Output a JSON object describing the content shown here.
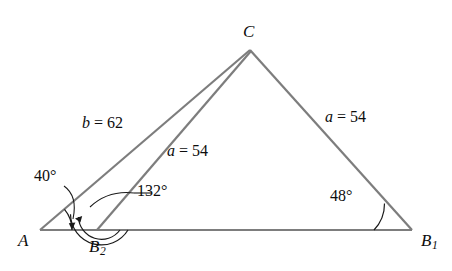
{
  "figure": {
    "type": "geometry-diagram",
    "vertices": [
      {
        "id": "C",
        "label": "C",
        "sub": "",
        "x": 250,
        "y": 50
      },
      {
        "id": "A",
        "label": "A",
        "sub": "",
        "x": 40,
        "y": 230
      },
      {
        "id": "B2",
        "label": "B",
        "sub": "2",
        "x": 97,
        "y": 230
      },
      {
        "id": "B1",
        "label": "B",
        "sub": "1",
        "x": 412,
        "y": 230
      }
    ],
    "side_labels": [
      {
        "id": "b-62",
        "var": "b",
        "eq": " = ",
        "value": "62",
        "text": "b = 62"
      },
      {
        "id": "a-54-inner",
        "var": "a",
        "eq": " = ",
        "value": "54",
        "text": "a = 54"
      },
      {
        "id": "a-54-right",
        "var": "a",
        "eq": " = ",
        "value": "54",
        "text": "a = 54"
      }
    ],
    "angle_labels": [
      {
        "id": "angle-40",
        "text": "40°",
        "at_vertex": "A",
        "value": 40
      },
      {
        "id": "angle-132",
        "text": "132°",
        "at_vertex": "B2",
        "value": 132
      },
      {
        "id": "angle-48",
        "text": "48°",
        "at_vertex": "B1",
        "value": 48
      }
    ],
    "colors": {
      "stroke": "#7d7d7d",
      "arc_stroke": "#1a1a1a",
      "text": "#0d0d0d",
      "background": "#ffffff"
    }
  }
}
